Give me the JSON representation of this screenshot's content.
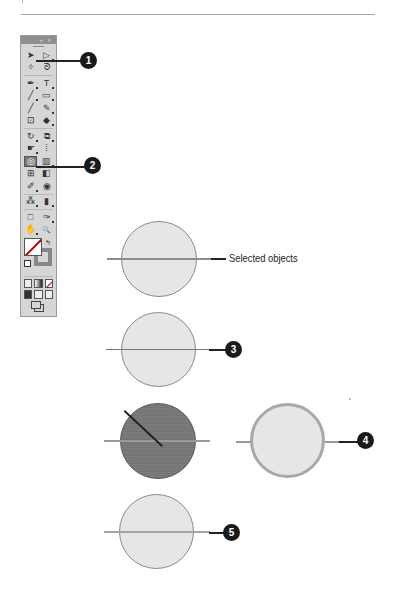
{
  "page": {
    "rule_color": "#a9a9a9"
  },
  "tool_panel": {
    "header_controls": [
      "collapse-icon",
      "close-icon"
    ],
    "collapse_glyph": "«",
    "close_glyph": "×",
    "rows": [
      {
        "left": "selection-tool-icon",
        "left_glyph": "➤",
        "right": "direct-selection-tool-icon",
        "right_glyph": "▷"
      },
      {
        "left": "magic-wand-tool-icon",
        "left_glyph": "✧",
        "right": "lasso-tool-icon",
        "right_glyph": "ᘐ"
      },
      {
        "left": "pen-tool-icon",
        "left_glyph": "✒",
        "right": "type-tool-icon",
        "right_glyph": "T"
      },
      {
        "left": "line-segment-tool-icon",
        "left_glyph": "╱",
        "right": "rectangle-tool-icon",
        "right_glyph": "▭"
      },
      {
        "left": "paintbrush-tool-icon",
        "left_glyph": "╱",
        "right": "pencil-tool-icon",
        "right_glyph": "✎"
      },
      {
        "left": "blob-brush-tool-icon",
        "left_glyph": "⊡",
        "right": "eraser-tool-icon",
        "right_glyph": "◆"
      },
      {
        "left": "rotate-tool-icon",
        "left_glyph": "↻",
        "right": "scale-tool-icon",
        "right_glyph": "⧉"
      },
      {
        "left": "warp-tool-icon",
        "left_glyph": "☛",
        "right": "free-transform-tool-icon",
        "right_glyph": "⁞"
      },
      {
        "left": "shape-builder-tool-icon",
        "left_glyph": "◎",
        "right": "perspective-grid-tool-icon",
        "right_glyph": "▥",
        "left_active": true
      },
      {
        "left": "mesh-tool-icon",
        "left_glyph": "⊞",
        "right": "gradient-tool-icon",
        "right_glyph": "◧"
      },
      {
        "left": "eyedropper-tool-icon",
        "left_glyph": "✐",
        "right": "blend-tool-icon",
        "right_glyph": "◉"
      },
      {
        "left": "symbol-sprayer-tool-icon",
        "left_glyph": "⁂",
        "right": "column-graph-tool-icon",
        "right_glyph": "▮"
      },
      {
        "left": "artboard-tool-icon",
        "left_glyph": "□",
        "right": "slice-tool-icon",
        "right_glyph": "✑"
      },
      {
        "left": "hand-tool-icon",
        "left_glyph": "✋",
        "right": "zoom-tool-icon",
        "right_glyph": "🔍"
      }
    ],
    "swap_glyph": "↰"
  },
  "callouts": [
    {
      "number": "1"
    },
    {
      "number": "2"
    },
    {
      "number": "3"
    },
    {
      "number": "4"
    },
    {
      "number": "5"
    }
  ],
  "figure": {
    "selected_objects_label": "Selected objects"
  },
  "colors": {
    "callout_bg": "#1a1a1a",
    "circle_fill": "#e6e6e6",
    "circle_dark_fill": "#7d7d7d",
    "panel_bg": "#d6d6d6"
  }
}
